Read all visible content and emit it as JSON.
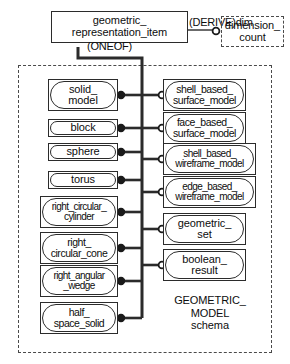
{
  "diagram": {
    "type": "EXPRESS-G entity relationship diagram",
    "schema_caption": "GEOMETRIC_\nMODEL\nschema",
    "root": {
      "label": "geometric_\nrepresentation_item"
    },
    "relationships": {
      "oneof_label": "(ONEOF)",
      "derive_label": "(DERIVE)dim"
    },
    "derived_attribute": {
      "label": "dimension_\ncount"
    },
    "subtypes_left": [
      {
        "label": "solid_\nmodel",
        "lines": 2
      },
      {
        "label": "block",
        "lines": 1
      },
      {
        "label": "sphere",
        "lines": 1
      },
      {
        "label": "torus",
        "lines": 1
      },
      {
        "label": "right_circular_\ncylinder",
        "lines": 2
      },
      {
        "label": "right_\ncircular_cone",
        "lines": 2
      },
      {
        "label": "right_angular\n_wedge",
        "lines": 2
      },
      {
        "label": "half_\nspace_solid",
        "lines": 2
      }
    ],
    "subtypes_right": [
      {
        "label": "shell_based_\nsurface_model",
        "lines": 2
      },
      {
        "label": "face_based_\nsurface_model",
        "lines": 2
      },
      {
        "label": "shell_based_\nwireframe_model",
        "lines": 2
      },
      {
        "label": "edge_based_\nwireframe_model",
        "lines": 2
      },
      {
        "label": "geometric_\nset",
        "lines": 2
      },
      {
        "label": "boolean_\nresult",
        "lines": 2
      }
    ],
    "colors": {
      "line": "#2b2b2b",
      "background": "#ffffff",
      "text": "#0d0d0d",
      "dashed": "#4a4a4a"
    }
  }
}
